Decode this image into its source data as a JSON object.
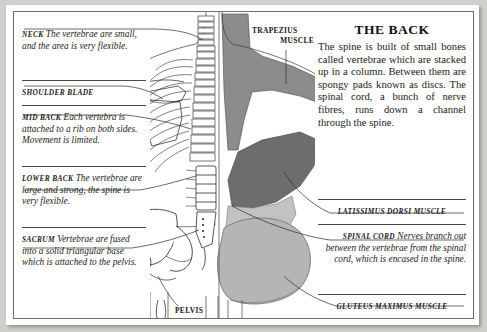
{
  "page": {
    "title": "THE BACK",
    "intro": "The spine is built of small bones called vertebrae which are stacked up in a column. Between them are spongy pads known as discs. The spinal cord, a bunch of nerve fibres, runs down a channel through the spine."
  },
  "colors": {
    "paper": "#ffffff",
    "border": "#6d6d6d",
    "ink": "#1a1a1a",
    "muscle_dark": "#6d6d6d",
    "muscle_mid": "#8c8c8c",
    "muscle_light": "#b5b5b5",
    "bone_outline": "#333333"
  },
  "left_column": [
    {
      "id": "neck",
      "heading": "NECK",
      "body": "The vertebrae are small, and the area is very flexible."
    },
    {
      "id": "shoulder-blade",
      "heading": "SHOULDER BLADE",
      "body": ""
    },
    {
      "id": "mid-back",
      "heading": "MID BACK",
      "body": "Each vertebra is attached to a rib on both sides. Movement is limited."
    },
    {
      "id": "lower-back",
      "heading": "LOWER BACK",
      "body": "The vertebrae are large and strong, the spine is very flexible."
    },
    {
      "id": "sacrum",
      "heading": "SACRUM",
      "body": "Vertebrae are fused into a solid triangular base which is attached to the pelvis."
    }
  ],
  "right_column": [
    {
      "id": "latissimus-dorsi",
      "heading": "LATISSIMUS DORSI MUSCLE",
      "body": ""
    },
    {
      "id": "spinal-cord",
      "heading": "SPINAL CORD",
      "body": "Nerves branch out between the vertebrae from the spinal cord, which is encased in the spine."
    },
    {
      "id": "gluteus-maximus",
      "heading": "GLUTEUS MAXIMUS MUSCLE",
      "body": ""
    }
  ],
  "center_labels": [
    {
      "id": "trapezius",
      "line1": "TRAPEZIUS",
      "line2": "MUSCLE"
    },
    {
      "id": "pelvis",
      "line1": "PELVIS",
      "line2": ""
    }
  ]
}
